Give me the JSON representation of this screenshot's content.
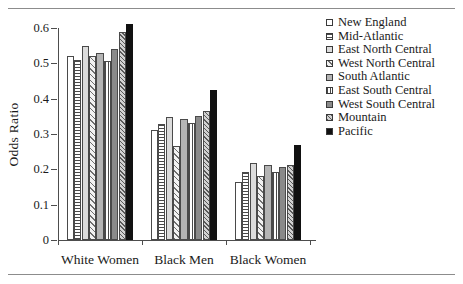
{
  "figure": {
    "top_rule": true,
    "bottom_rule": true
  },
  "chart_data": {
    "type": "bar",
    "title": "",
    "xlabel": "",
    "ylabel": "Odds Ratio",
    "ylim": [
      0,
      0.6
    ],
    "ytick_labels": [
      "0",
      "0.1",
      "0.2",
      "0.3",
      "0.4",
      "0.5",
      "0.6"
    ],
    "ytick_values": [
      0,
      0.1,
      0.2,
      0.3,
      0.4,
      0.5,
      0.6
    ],
    "grid": false,
    "legend_position": "right",
    "categories": [
      "White Women",
      "Black Men",
      "Black Women"
    ],
    "series": [
      {
        "name": "New England",
        "pattern": "p-white",
        "values": [
          0.521,
          0.31,
          0.165
        ]
      },
      {
        "name": "Mid-Atlantic",
        "pattern": "p-hlines",
        "values": [
          0.509,
          0.327,
          0.192
        ]
      },
      {
        "name": "East North Central",
        "pattern": "p-lightgray",
        "values": [
          0.549,
          0.347,
          0.218
        ]
      },
      {
        "name": "West North Central",
        "pattern": "p-diag",
        "values": [
          0.52,
          0.266,
          0.181
        ]
      },
      {
        "name": "South Atlantic",
        "pattern": "p-gray",
        "values": [
          0.529,
          0.343,
          0.211
        ]
      },
      {
        "name": "East South Central",
        "pattern": "p-vlines",
        "values": [
          0.506,
          0.33,
          0.192
        ]
      },
      {
        "name": "West South Central",
        "pattern": "p-darkgray",
        "values": [
          0.54,
          0.352,
          0.207
        ]
      },
      {
        "name": "Mountain",
        "pattern": "p-diag2",
        "values": [
          0.588,
          0.364,
          0.213
        ]
      },
      {
        "name": "Pacific",
        "pattern": "p-black",
        "values": [
          0.612,
          0.424,
          0.27
        ]
      }
    ]
  }
}
